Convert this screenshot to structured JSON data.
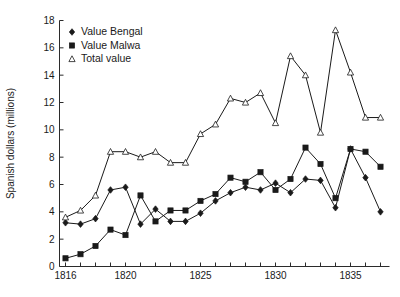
{
  "chart_data": {
    "type": "line",
    "title": "",
    "xlabel": "",
    "ylabel": "Spanish dollars (millions)",
    "xlim": [
      1815.6,
      1837.6
    ],
    "ylim": [
      0,
      18
    ],
    "xticks": [
      1816,
      1817,
      1818,
      1819,
      1820,
      1821,
      1822,
      1823,
      1824,
      1825,
      1826,
      1827,
      1828,
      1829,
      1830,
      1831,
      1832,
      1833,
      1834,
      1835,
      1836,
      1837
    ],
    "xtick_labels": [
      "1816",
      "",
      "",
      "",
      "1820",
      "",
      "",
      "",
      "",
      "1825",
      "",
      "",
      "",
      "",
      "1830",
      "",
      "",
      "",
      "",
      "1835",
      "",
      ""
    ],
    "yticks": [
      0,
      2,
      4,
      6,
      8,
      10,
      12,
      14,
      16,
      18
    ],
    "ytick_labels": [
      "0",
      "2",
      "4",
      "6",
      "8",
      "10",
      "12",
      "14",
      "16",
      "18"
    ],
    "grid": false,
    "legend_position": "top-left",
    "x": [
      1816,
      1817,
      1818,
      1819,
      1820,
      1821,
      1822,
      1823,
      1824,
      1825,
      1826,
      1827,
      1828,
      1829,
      1830,
      1831,
      1832,
      1833,
      1834,
      1835,
      1836,
      1837
    ],
    "series": [
      {
        "name": "Value Bengal",
        "marker": "diamond",
        "values": [
          3.2,
          3.1,
          3.5,
          5.6,
          5.8,
          3.1,
          4.2,
          3.3,
          3.3,
          3.9,
          4.8,
          5.4,
          5.8,
          5.6,
          6.1,
          5.4,
          6.4,
          6.3,
          4.3,
          8.6,
          6.5,
          4.0
        ]
      },
      {
        "name": "Value Malwa",
        "marker": "square",
        "values": [
          0.6,
          0.9,
          1.5,
          2.7,
          2.3,
          5.2,
          3.3,
          4.1,
          4.1,
          4.8,
          5.3,
          6.5,
          6.2,
          6.9,
          5.6,
          6.4,
          8.7,
          7.5,
          5.0,
          8.6,
          8.4,
          7.3
        ]
      },
      {
        "name": "Total value",
        "marker": "triangle-open",
        "values": [
          3.6,
          4.1,
          5.2,
          8.4,
          8.4,
          8.0,
          8.4,
          7.6,
          7.6,
          9.7,
          10.4,
          12.3,
          12.0,
          12.7,
          10.5,
          15.4,
          14.0,
          9.8,
          17.3,
          14.2,
          10.9,
          10.9
        ]
      }
    ]
  },
  "legend": {
    "items": [
      {
        "label": "Value Bengal",
        "marker": "diamond"
      },
      {
        "label": "Value Malwa",
        "marker": "square"
      },
      {
        "label": "Total value",
        "marker": "triangle-open"
      }
    ]
  }
}
